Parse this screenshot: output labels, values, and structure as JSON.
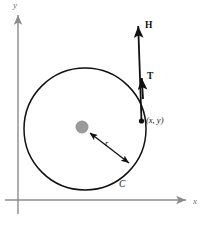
{
  "figure": {
    "type": "geometry-diagram",
    "background_color": "#ffffff",
    "axes": {
      "color": "#8c8c8c",
      "x_label": "x",
      "y_label": "y",
      "origin": {
        "x": 18,
        "y": 200
      },
      "x_axis_end": {
        "x": 190,
        "y": 200
      },
      "y_axis_end": {
        "x": 18,
        "y": 12
      }
    },
    "circle": {
      "label": "C",
      "stroke_color": "#111111",
      "center": {
        "x": 85,
        "y": 129
      },
      "radius": 61
    },
    "center_dot": {
      "color": "#9a9a9a",
      "center": {
        "x": 82,
        "y": 127
      },
      "radius": 6.5
    },
    "radius_arrow": {
      "label": "r",
      "from": {
        "x": 89,
        "y": 132
      },
      "to": {
        "x": 130,
        "y": 164
      },
      "color": "#111111",
      "double_headed": true
    },
    "point": {
      "label": "(x, y)",
      "position": {
        "x": 141,
        "y": 121
      },
      "dot_color": "#111111",
      "dot_radius": 2.6
    },
    "vector_T": {
      "label": "T",
      "tip": {
        "x": 142,
        "y": 73
      },
      "color": "#111111"
    },
    "vector_H": {
      "label": "H",
      "tip": {
        "x": 138,
        "y": 21
      },
      "color": "#111111"
    }
  }
}
